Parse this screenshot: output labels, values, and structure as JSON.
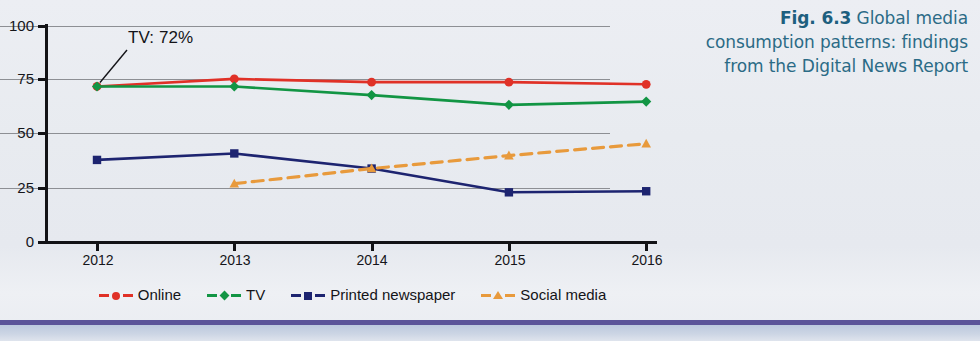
{
  "caption": {
    "label": "Fig. 6.3",
    "text": "Global media consumption patterns: findings from the Digital News Report",
    "color": "#2b6b86"
  },
  "annotation": {
    "text": "TV: 72%"
  },
  "legend": {
    "items": [
      {
        "label": "Online",
        "color": "#e03127",
        "marker": "circle"
      },
      {
        "label": "TV",
        "color": "#129544",
        "marker": "diamond"
      },
      {
        "label": "Printed newspaper",
        "color": "#1d2470",
        "marker": "square"
      },
      {
        "label": "Social media",
        "color": "#e89a3c",
        "marker": "triangle"
      }
    ]
  },
  "axes": {
    "y_ticks": [
      "100",
      "75",
      "50",
      "25",
      "0"
    ],
    "x_ticks": [
      "2012",
      "2013",
      "2014",
      "2015",
      "2016"
    ]
  },
  "chart_data": {
    "type": "line",
    "title": "",
    "xlabel": "",
    "ylabel": "",
    "categories": [
      "2012",
      "2013",
      "2014",
      "2015",
      "2016"
    ],
    "ylim": [
      0,
      100
    ],
    "yticks": [
      0,
      25,
      50,
      75,
      100
    ],
    "grid": true,
    "legend_position": "bottom",
    "annotations": [
      {
        "text": "TV: 72%",
        "series": "TV",
        "x": "2012",
        "y": 72
      }
    ],
    "series": [
      {
        "name": "Online",
        "color": "#e03127",
        "marker": "circle",
        "linestyle": "solid",
        "values": [
          72,
          75.5,
          74,
          74,
          73
        ]
      },
      {
        "name": "TV",
        "color": "#129544",
        "marker": "diamond",
        "linestyle": "solid",
        "values": [
          72,
          72,
          68,
          63.5,
          65
        ]
      },
      {
        "name": "Printed newspaper",
        "color": "#1d2470",
        "marker": "square",
        "linestyle": "solid",
        "values": [
          38,
          41,
          34,
          23,
          23.5
        ]
      },
      {
        "name": "Social media",
        "color": "#e89a3c",
        "marker": "triangle",
        "linestyle": "dashed",
        "values": [
          null,
          27,
          34,
          40,
          45.5
        ]
      }
    ]
  }
}
